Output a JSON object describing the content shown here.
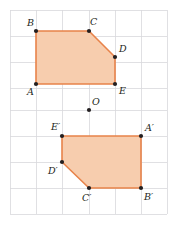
{
  "figure": {
    "width": 177,
    "height": 225,
    "background": "#ffffff",
    "grid": {
      "visible": true,
      "color": "#d8d8dc",
      "spacing": 26,
      "origin_x": 10,
      "origin_y": 10,
      "x_lines": [
        10,
        36,
        62,
        89,
        115,
        141,
        167
      ],
      "y_lines": [
        10,
        36,
        62,
        88,
        110,
        136,
        162,
        188,
        214
      ]
    },
    "style": {
      "fill": "#f7cdae",
      "stroke": "#e8834a",
      "stroke_width": 1.6,
      "dot_color": "#231f20",
      "dot_radius": 2.1,
      "label_color": "#231f20"
    },
    "shapes": [
      {
        "name": "pentagon-abcde",
        "points": "36,31 89,31 115,57 115,84 36,84",
        "vertices": [
          {
            "id": "A",
            "label": "A",
            "x": 36,
            "y": 84,
            "label_x": 27,
            "label_y": 92
          },
          {
            "id": "B",
            "label": "B",
            "x": 36,
            "y": 31,
            "label_x": 27,
            "label_y": 23
          },
          {
            "id": "C",
            "label": "C",
            "x": 89,
            "y": 31,
            "label_x": 90,
            "label_y": 22
          },
          {
            "id": "D",
            "label": "D",
            "x": 115,
            "y": 57,
            "label_x": 119,
            "label_y": 49
          },
          {
            "id": "E",
            "label": "E",
            "x": 115,
            "y": 84,
            "label_x": 119,
            "label_y": 91
          }
        ]
      },
      {
        "name": "pentagon-a-prime-b-prime-c-prime-d-prime-e-prime",
        "points": "141,136 141,188 89,188 62,162 62,136",
        "vertices": [
          {
            "id": "A-prime",
            "label": "A′",
            "x": 141,
            "y": 136,
            "label_x": 145,
            "label_y": 128
          },
          {
            "id": "B-prime",
            "label": "B′",
            "x": 141,
            "y": 188,
            "label_x": 144,
            "label_y": 197
          },
          {
            "id": "C-prime",
            "label": "C′",
            "x": 89,
            "y": 188,
            "label_x": 82,
            "label_y": 198
          },
          {
            "id": "D-prime",
            "label": "D′",
            "x": 62,
            "y": 162,
            "label_x": 48,
            "label_y": 171
          },
          {
            "id": "E-prime",
            "label": "E′",
            "x": 62,
            "y": 136,
            "label_x": 51,
            "label_y": 127
          }
        ]
      }
    ],
    "center": {
      "id": "O",
      "label": "O",
      "x": 89,
      "y": 110,
      "label_x": 92,
      "label_y": 102
    }
  }
}
